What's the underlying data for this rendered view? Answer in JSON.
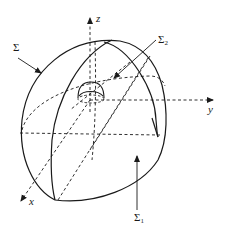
{
  "figure": {
    "stroke_color": "#1a1a1a",
    "background_color": "#ffffff"
  },
  "axes": {
    "x": {
      "label": "x"
    },
    "y": {
      "label": "y"
    },
    "z": {
      "label": "z"
    }
  },
  "labels": {
    "sigma": {
      "symbol": "Σ",
      "subscript": ""
    },
    "sigma_1": {
      "symbol": "Σ",
      "subscript": "1"
    },
    "sigma_2": {
      "symbol": "Σ",
      "subscript": "2"
    }
  }
}
